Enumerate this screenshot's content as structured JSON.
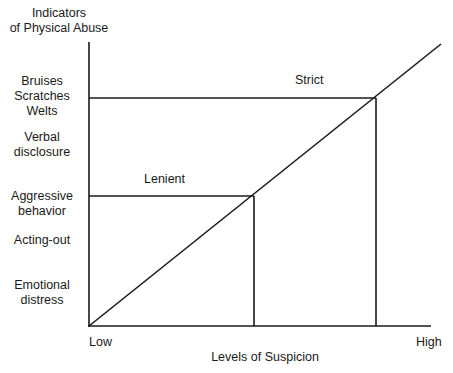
{
  "diagram": {
    "y_axis_title": [
      "Indicators",
      "of Physical Abuse"
    ],
    "x_axis_title": "Levels of Suspicion",
    "x_ticks": {
      "low": "Low",
      "high": "High"
    },
    "y_labels": [
      {
        "lines": [
          "Bruises",
          "Scratches",
          "Welts"
        ]
      },
      {
        "lines": [
          "Verbal",
          "disclosure"
        ]
      },
      {
        "lines": [
          "Aggressive",
          "behavior"
        ]
      },
      {
        "lines": [
          "Acting-out"
        ]
      },
      {
        "lines": [
          "Emotional",
          "distress"
        ]
      }
    ],
    "thresholds": [
      {
        "label": "Lenient"
      },
      {
        "label": "Strict"
      }
    ],
    "line_color": "#1a1a1a"
  }
}
